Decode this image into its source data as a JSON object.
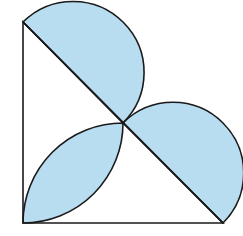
{
  "diagram": {
    "title": "",
    "colors": {
      "fill": "#b8dcf0",
      "stroke": "#1a1a1a",
      "background": "#ffffff"
    },
    "points": {
      "top": [
        23,
        22
      ],
      "right_angle": [
        23,
        223
      ],
      "right": [
        223,
        223
      ],
      "midpoint": [
        123,
        123
      ]
    },
    "shapes": [
      {
        "name": "upper-semicircle-segment",
        "shaded": true
      },
      {
        "name": "lower-semicircle-segment",
        "shaded": true
      },
      {
        "name": "corner-lens",
        "shaded": true
      },
      {
        "name": "triangle-outline",
        "shaded": false
      }
    ]
  }
}
